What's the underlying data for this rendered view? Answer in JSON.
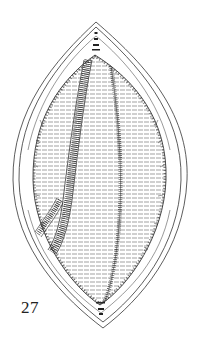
{
  "figure": {
    "label": "27",
    "colors": {
      "ink": "#222222",
      "background": "#ffffff"
    }
  }
}
